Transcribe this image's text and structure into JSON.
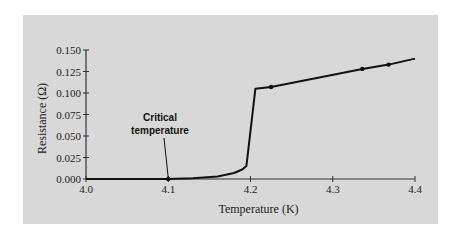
{
  "chart_data": {
    "type": "line",
    "title": "",
    "xlabel": "Temperature (K)",
    "ylabel": "Resistance (Ω)",
    "xlim": [
      4.0,
      4.4
    ],
    "ylim": [
      0.0,
      0.15
    ],
    "x_ticks": [
      "4.0",
      "4.1",
      "4.2",
      "4.3",
      "4.4"
    ],
    "y_ticks": [
      "0.000",
      "0.025",
      "0.050",
      "0.075",
      "0.100",
      "0.125",
      "0.150"
    ],
    "grid": false,
    "legend": null,
    "series": [
      {
        "name": "Resistance vs Temperature",
        "color": "#111111",
        "points": [
          [
            4.0,
            0.0
          ],
          [
            4.05,
            0.0
          ],
          [
            4.1,
            0.0
          ],
          [
            4.13,
            0.0008
          ],
          [
            4.16,
            0.003
          ],
          [
            4.18,
            0.007
          ],
          [
            4.19,
            0.011
          ],
          [
            4.195,
            0.015
          ],
          [
            4.206,
            0.105
          ],
          [
            4.225,
            0.107
          ],
          [
            4.336,
            0.128
          ],
          [
            4.368,
            0.133
          ],
          [
            4.4,
            0.14
          ]
        ],
        "markers": [
          [
            4.1,
            0.0
          ],
          [
            4.225,
            0.107
          ],
          [
            4.336,
            0.128
          ],
          [
            4.368,
            0.133
          ]
        ]
      }
    ],
    "annotations": [
      {
        "text": "Critical temperature",
        "lines": [
          "Critical",
          "temperature"
        ],
        "points_to": [
          4.1,
          0.0
        ]
      }
    ]
  },
  "colors": {
    "panel_background": "#d8d8d8",
    "line": "#111111",
    "axis": "#333333"
  }
}
